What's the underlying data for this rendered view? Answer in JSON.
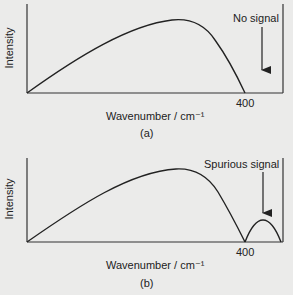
{
  "panels": [
    {
      "id": "a",
      "caption": "(a)",
      "ylabel": "Intensity",
      "xlabel": "Wavenumber / cm⁻¹",
      "tick_label": "400",
      "annotation": "No signal"
    },
    {
      "id": "b",
      "caption": "(b)",
      "ylabel": "Intensity",
      "xlabel": "Wavenumber / cm⁻¹",
      "tick_label": "400",
      "annotation": "Spurious signal"
    }
  ]
}
